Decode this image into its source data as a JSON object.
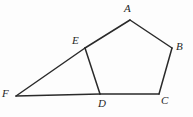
{
  "figure": {
    "canvas": {
      "width": 193,
      "height": 117
    },
    "background_color": "#fdfdfd",
    "stroke_color": "#2a2a2a",
    "stroke_width": 1.5,
    "points": {
      "A": {
        "x": 130,
        "y": 20,
        "label": "A",
        "label_x": 124,
        "label_y": 3
      },
      "B": {
        "x": 172,
        "y": 48,
        "label": "B",
        "label_x": 176,
        "label_y": 41
      },
      "C": {
        "x": 159,
        "y": 94,
        "label": "C",
        "label_x": 161,
        "label_y": 95
      },
      "D": {
        "x": 100,
        "y": 94,
        "label": "D",
        "label_x": 98,
        "label_y": 98
      },
      "E": {
        "x": 85,
        "y": 48,
        "label": "E",
        "label_x": 72,
        "label_y": 35
      },
      "F": {
        "x": 16,
        "y": 96,
        "label": "F",
        "label_x": 2,
        "label_y": 88
      }
    },
    "segments": [
      {
        "name": "segment-AB",
        "from": "A",
        "to": "B"
      },
      {
        "name": "segment-BC",
        "from": "B",
        "to": "C"
      },
      {
        "name": "segment-CD",
        "from": "C",
        "to": "D"
      },
      {
        "name": "segment-DF",
        "from": "D",
        "to": "F"
      },
      {
        "name": "segment-FE",
        "from": "F",
        "to": "E"
      },
      {
        "name": "segment-EA",
        "from": "E",
        "to": "A"
      },
      {
        "name": "segment-ED",
        "from": "E",
        "to": "D"
      }
    ]
  }
}
